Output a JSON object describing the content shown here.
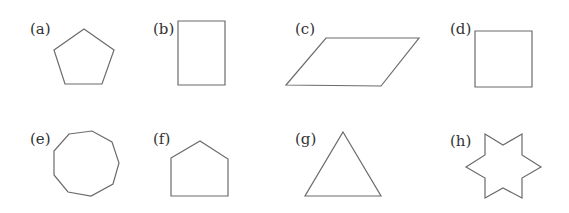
{
  "figure": {
    "background": "#ffffff",
    "stroke_color": "#6b6b6b",
    "label_color": "#333333",
    "shapes": [
      {
        "id": "a",
        "label": "(a)",
        "name": "pentagon",
        "label_pos": [
          30,
          34
        ],
        "points": "84,29 114,50 102,84 65,84 54,50"
      },
      {
        "id": "b",
        "label": "(b)",
        "name": "rectangle",
        "label_pos": [
          153,
          34
        ],
        "points": "178,21 225,21 225,85 178,85"
      },
      {
        "id": "c",
        "label": "(c)",
        "name": "parallelogram",
        "label_pos": [
          295,
          34
        ],
        "points": "326,38 419,38 381,86 286,85"
      },
      {
        "id": "d",
        "label": "(d)",
        "name": "square",
        "label_pos": [
          450,
          34
        ],
        "points": "475,31 532,31 532,87 475,87"
      },
      {
        "id": "e",
        "label": "(e)",
        "name": "nonagon",
        "label_pos": [
          30,
          144
        ],
        "points": "69,134 92,131 112,142 119,163 113,184 91,196 68,192 54,175 54,151"
      },
      {
        "id": "f",
        "label": "(f)",
        "name": "house-pentagon",
        "label_pos": [
          153,
          144
        ],
        "points": "171,158 200,141 228,159 228,196 171,196"
      },
      {
        "id": "g",
        "label": "(g)",
        "name": "triangle",
        "label_pos": [
          295,
          144
        ],
        "points": "343,132 381,196 305,196"
      },
      {
        "id": "h",
        "label": "(h)",
        "name": "six-pointed-star",
        "label_pos": [
          450,
          146
        ],
        "points": "485,134 503,145 522,134 522,155 541,167 522,178 522,198 503,188 485,198 485,178 466,167 485,155"
      }
    ]
  }
}
